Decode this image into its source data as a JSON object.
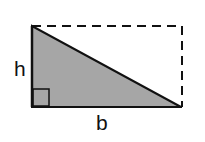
{
  "diagram": {
    "labels": {
      "height": "h",
      "base": "b"
    },
    "colors": {
      "fill": "#a6a6a6",
      "stroke": "#111111",
      "background": "#ffffff"
    },
    "shapes": {
      "triangle": [
        [
          32,
          26
        ],
        [
          32,
          107
        ],
        [
          181,
          107
        ]
      ],
      "rectangle": {
        "x": 32,
        "y": 26,
        "width": 150,
        "height": 81,
        "dashed": true
      },
      "right_angle_marker": {
        "x": 32,
        "y": 89,
        "size": 17
      }
    }
  }
}
